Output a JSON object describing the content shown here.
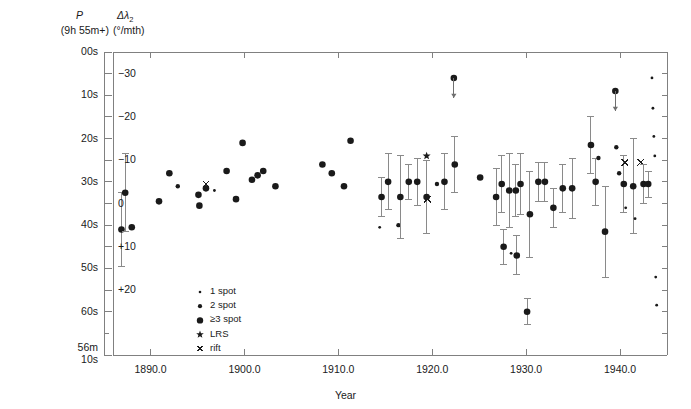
{
  "figure": {
    "width": 691,
    "height": 409,
    "background": "#ffffff",
    "ink": "#1a1a1a",
    "axis_color": "#808080"
  },
  "header": {
    "left_axis_title_line1": "P",
    "left_axis_title_line2": "(9h 55m+)",
    "right_axis_title_line1_main": "Δλ",
    "right_axis_title_line1_sub": "2",
    "right_axis_title_line2": "(°/mth)"
  },
  "axes": {
    "xlabel": "Year",
    "x_ticks": [
      "1890.0",
      "1900.0",
      "1910.0",
      "1920.0",
      "1930.0",
      "1940.0"
    ],
    "x_tick_values": [
      1890,
      1900,
      1910,
      1920,
      1930,
      1940
    ],
    "xlim": [
      1886.0,
      1945.0
    ],
    "y_left_ticks": [
      "00s",
      "10s",
      "20s",
      "30s",
      "40s",
      "50s",
      "60s",
      "56m\n10s"
    ],
    "y_left_labels": [
      "00s",
      "10s",
      "20s",
      "30s",
      "40s",
      "50s",
      "60s"
    ],
    "y_left_bottom_label_line1": "56m",
    "y_left_bottom_label_line2": "10s",
    "y_right_ticks": [
      "−30",
      "−20",
      "−10",
      "0",
      "+10",
      "+20"
    ],
    "y_right_values": [
      -30,
      -20,
      -10,
      0,
      10,
      20
    ],
    "ylim_seconds": [
      0,
      70
    ],
    "ylim_drift": [
      -33.5,
      21.5
    ],
    "grid": false
  },
  "legend": {
    "position": "inside-lower-left",
    "items": [
      {
        "symbol": "dot-tiny",
        "label": "1 spot",
        "radius": 1.3
      },
      {
        "symbol": "dot-small",
        "label": "2 spot",
        "radius": 2.1
      },
      {
        "symbol": "dot-large",
        "label": "≥3 spot",
        "radius": 3.2
      },
      {
        "symbol": "star",
        "label": "LRS",
        "radius": 4.0
      },
      {
        "symbol": "cross",
        "label": "rift",
        "radius": 3.2
      }
    ]
  },
  "chart_data": {
    "type": "scatter",
    "title": "",
    "xlabel": "Year",
    "ylabel": "P (9h 55m+) / Δλ2 (°/mth)",
    "xlim": [
      1886.0,
      1945.0
    ],
    "ylim_seconds": [
      0,
      70
    ],
    "ylim_drift": [
      -33.5,
      21.5
    ],
    "grid": false,
    "points": [
      {
        "x": 1886.9,
        "y": 41.0,
        "err": 8.5,
        "cls": "3"
      },
      {
        "x": 1887.3,
        "y": 32.5,
        "err": 9.0,
        "cls": "3"
      },
      {
        "x": 1888.0,
        "y": 40.5,
        "err": 0,
        "cls": "3"
      },
      {
        "x": 1890.9,
        "y": 34.5,
        "err": 0,
        "cls": "3"
      },
      {
        "x": 1892.0,
        "y": 28.0,
        "err": 0,
        "cls": "3"
      },
      {
        "x": 1892.9,
        "y": 31.0,
        "err": 0,
        "cls": "2"
      },
      {
        "x": 1895.1,
        "y": 33.0,
        "err": 0,
        "cls": "3"
      },
      {
        "x": 1895.2,
        "y": 35.5,
        "err": 0,
        "cls": "3"
      },
      {
        "x": 1895.9,
        "y": 30.5,
        "err": 0,
        "cls": "R"
      },
      {
        "x": 1895.9,
        "y": 31.5,
        "err": 0,
        "cls": "3"
      },
      {
        "x": 1896.8,
        "y": 32.0,
        "err": 0,
        "cls": "1"
      },
      {
        "x": 1898.1,
        "y": 27.5,
        "err": 0,
        "cls": "3"
      },
      {
        "x": 1899.1,
        "y": 34.0,
        "err": 0,
        "cls": "3"
      },
      {
        "x": 1899.8,
        "y": 21.0,
        "err": 0,
        "cls": "3"
      },
      {
        "x": 1900.8,
        "y": 29.5,
        "err": 0,
        "cls": "3"
      },
      {
        "x": 1901.4,
        "y": 28.5,
        "err": 0,
        "cls": "3"
      },
      {
        "x": 1902.0,
        "y": 27.5,
        "err": 0,
        "cls": "3"
      },
      {
        "x": 1903.3,
        "y": 31.0,
        "err": 0,
        "cls": "3"
      },
      {
        "x": 1908.3,
        "y": 26.0,
        "err": 0,
        "cls": "3"
      },
      {
        "x": 1909.3,
        "y": 28.0,
        "err": 0,
        "cls": "3"
      },
      {
        "x": 1910.6,
        "y": 31.0,
        "err": 0,
        "cls": "3"
      },
      {
        "x": 1911.3,
        "y": 20.5,
        "err": 0,
        "cls": "3"
      },
      {
        "x": 1914.4,
        "y": 40.5,
        "err": 0,
        "cls": "1"
      },
      {
        "x": 1914.6,
        "y": 33.5,
        "err": 4.5,
        "cls": "3"
      },
      {
        "x": 1915.3,
        "y": 30.0,
        "err": 6.5,
        "cls": "3"
      },
      {
        "x": 1916.4,
        "y": 40.0,
        "err": 0,
        "cls": "2"
      },
      {
        "x": 1916.6,
        "y": 33.5,
        "err": 9.5,
        "cls": "3"
      },
      {
        "x": 1917.5,
        "y": 30.0,
        "err": 4.0,
        "cls": "3"
      },
      {
        "x": 1918.4,
        "y": 30.0,
        "err": 5.5,
        "cls": "3"
      },
      {
        "x": 1919.4,
        "y": 24.0,
        "err": 0,
        "cls": "L"
      },
      {
        "x": 1919.4,
        "y": 33.5,
        "err": 8.5,
        "cls": "3"
      },
      {
        "x": 1919.5,
        "y": 34.0,
        "err": 0,
        "cls": "R"
      },
      {
        "x": 1920.5,
        "y": 30.5,
        "err": 0,
        "cls": "2"
      },
      {
        "x": 1921.3,
        "y": 30.0,
        "err": 6.5,
        "cls": "3"
      },
      {
        "x": 1922.3,
        "y": 6.0,
        "err": 0,
        "cls": "A"
      },
      {
        "x": 1922.4,
        "y": 26.0,
        "err": 6.5,
        "cls": "3"
      },
      {
        "x": 1925.1,
        "y": 29.0,
        "err": 0,
        "cls": "3"
      },
      {
        "x": 1926.8,
        "y": 33.5,
        "err": 6.5,
        "cls": "3"
      },
      {
        "x": 1927.4,
        "y": 30.5,
        "err": 6.5,
        "cls": "3"
      },
      {
        "x": 1927.6,
        "y": 45.0,
        "err": 4.0,
        "cls": "3"
      },
      {
        "x": 1928.2,
        "y": 32.0,
        "err": 8.5,
        "cls": "3"
      },
      {
        "x": 1928.4,
        "y": 46.5,
        "err": 0,
        "cls": "1"
      },
      {
        "x": 1928.9,
        "y": 32.0,
        "err": 6.0,
        "cls": "3"
      },
      {
        "x": 1929.0,
        "y": 47.0,
        "err": 4.5,
        "cls": "3"
      },
      {
        "x": 1929.4,
        "y": 30.5,
        "err": 7.0,
        "cls": "3"
      },
      {
        "x": 1930.1,
        "y": 60.0,
        "err": 3.0,
        "cls": "3"
      },
      {
        "x": 1930.4,
        "y": 37.5,
        "err": 10.0,
        "cls": "3"
      },
      {
        "x": 1931.3,
        "y": 30.0,
        "err": 4.5,
        "cls": "3"
      },
      {
        "x": 1932.0,
        "y": 30.0,
        "err": 4.5,
        "cls": "3"
      },
      {
        "x": 1932.9,
        "y": 36.0,
        "err": 4.5,
        "cls": "3"
      },
      {
        "x": 1933.9,
        "y": 31.5,
        "err": 5.5,
        "cls": "3"
      },
      {
        "x": 1934.9,
        "y": 31.5,
        "err": 7.0,
        "cls": "3"
      },
      {
        "x": 1936.9,
        "y": 21.5,
        "err": 6.5,
        "cls": "3"
      },
      {
        "x": 1937.4,
        "y": 30.0,
        "err": 5.5,
        "cls": "3"
      },
      {
        "x": 1937.7,
        "y": 24.5,
        "err": 0,
        "cls": "2"
      },
      {
        "x": 1938.4,
        "y": 41.5,
        "err": 10.5,
        "cls": "3"
      },
      {
        "x": 1939.5,
        "y": 9.0,
        "err": 0,
        "cls": "A"
      },
      {
        "x": 1939.6,
        "y": 22.0,
        "err": 0,
        "cls": "2"
      },
      {
        "x": 1939.9,
        "y": 28.0,
        "err": 0,
        "cls": "2"
      },
      {
        "x": 1940.4,
        "y": 30.5,
        "err": 6.5,
        "cls": "3"
      },
      {
        "x": 1940.5,
        "y": 25.5,
        "err": 0,
        "cls": "R"
      },
      {
        "x": 1940.6,
        "y": 36.0,
        "err": 0,
        "cls": "1"
      },
      {
        "x": 1941.4,
        "y": 31.0,
        "err": 11.0,
        "cls": "3"
      },
      {
        "x": 1941.6,
        "y": 38.5,
        "err": 0,
        "cls": "1"
      },
      {
        "x": 1942.2,
        "y": 25.5,
        "err": 0,
        "cls": "R"
      },
      {
        "x": 1942.5,
        "y": 30.5,
        "err": 4.5,
        "cls": "3"
      },
      {
        "x": 1943.0,
        "y": 30.5,
        "err": 3.0,
        "cls": "3"
      },
      {
        "x": 1943.4,
        "y": 6.0,
        "err": 0,
        "cls": "1"
      },
      {
        "x": 1943.5,
        "y": 13.0,
        "err": 0,
        "cls": "1"
      },
      {
        "x": 1943.6,
        "y": 19.5,
        "err": 0,
        "cls": "1"
      },
      {
        "x": 1943.7,
        "y": 24.0,
        "err": 0,
        "cls": "1"
      },
      {
        "x": 1943.8,
        "y": 52.0,
        "err": 0,
        "cls": "1"
      },
      {
        "x": 1943.9,
        "y": 58.5,
        "err": 0,
        "cls": "1"
      }
    ]
  }
}
